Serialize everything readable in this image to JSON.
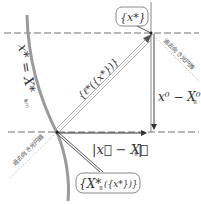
{
  "diagram": {
    "type": "geometric-schematic",
    "labels": {
      "top_box": "{x*}",
      "vertical_gap": "x⁰ − X⁰",
      "vertical_gap_sub": "象",
      "bottom_distance": "|x⃗ − X⃗",
      "bottom_distance_sub": "象",
      "bottom_distance_close": "|",
      "bottom_box": "{X*",
      "bottom_box_sub": "象",
      "bottom_box_arg": "({x*})}",
      "curve_label": "x* = X*",
      "curve_label_sub": "象(τ)",
      "diagonal_label": "{ℓ*({x*})}",
      "upper_cone_label": "過去向き光円錐",
      "lower_cone_label": "過去向き光円錐"
    },
    "colors": {
      "curve": "#9a9a9a",
      "dashed_line": "#707070",
      "arrow": "#444444",
      "text": "#333333",
      "box_border": "#888888"
    }
  }
}
